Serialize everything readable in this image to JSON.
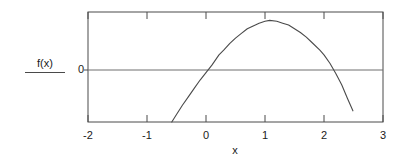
{
  "figure": {
    "ylabel": "f(x)",
    "zero_label": "0",
    "xlabel": "x"
  },
  "xticks": [
    {
      "label": "-2",
      "value": -2
    },
    {
      "label": "-1",
      "value": -1
    },
    {
      "label": "0",
      "value": 0
    },
    {
      "label": "1",
      "value": 1
    },
    {
      "label": "2",
      "value": 2
    },
    {
      "label": "3",
      "value": 3
    }
  ],
  "colors": {
    "curve": "#4a4a4a",
    "frame": "#4a4a4a",
    "zero_line": "#6e6e6e",
    "text": "#1a1a1a",
    "background": "#ffffff"
  },
  "chart_data": {
    "type": "line",
    "title": "",
    "xlabel": "x",
    "ylabel": "f(x)",
    "xlim": [
      -2,
      3
    ],
    "ylim": [
      -0.9,
      0.28
    ],
    "grid": false,
    "legend": null,
    "annotations": [
      {
        "text": "0",
        "kind": "y-axis-zero-level",
        "value": 0
      }
    ],
    "series": [
      {
        "name": "f(x)",
        "description": "downward-opening parabola; roots near x=0.22 and x=1.93, vertex near x=1.08",
        "x": [
          -0.58,
          -0.5,
          -0.4,
          -0.3,
          -0.2,
          -0.1,
          0.0,
          0.1,
          0.22,
          0.3,
          0.4,
          0.5,
          0.6,
          0.7,
          0.8,
          0.9,
          1.0,
          1.08,
          1.2,
          1.3,
          1.4,
          1.5,
          1.6,
          1.7,
          1.8,
          1.93,
          2.0,
          2.1,
          2.2,
          2.3,
          2.4,
          2.49
        ],
        "y": [
          -0.9,
          -0.82,
          -0.72,
          -0.63,
          -0.54,
          -0.45,
          -0.37,
          -0.29,
          -0.18,
          -0.13,
          -0.06,
          0.0,
          0.05,
          0.1,
          0.13,
          0.16,
          0.18,
          0.19,
          0.18,
          0.16,
          0.14,
          0.1,
          0.06,
          0.01,
          -0.05,
          -0.13,
          -0.18,
          -0.27,
          -0.38,
          -0.5,
          -0.65,
          -0.78
        ]
      }
    ]
  }
}
